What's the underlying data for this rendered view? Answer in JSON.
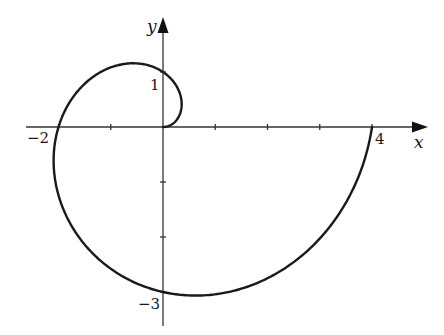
{
  "chart_data": {
    "type": "line",
    "title": "",
    "subtitle": "",
    "xlabel": "x",
    "ylabel": "y",
    "curve": "Archimedean spiral r = 2θ/π, θ from 0 to 2π",
    "xlim": [
      -2.2,
      5.0
    ],
    "ylim": [
      -3.5,
      2.0
    ],
    "grid": false,
    "legend": null,
    "x_ticks": [
      -2,
      -1,
      1,
      2,
      3,
      4
    ],
    "y_ticks": [
      1,
      -1,
      -2,
      -3
    ],
    "labeled_ticks": {
      "x": [
        {
          "value": -2,
          "label": "−2"
        },
        {
          "value": 4,
          "label": "4"
        }
      ],
      "y": [
        {
          "value": 1,
          "label": "1"
        },
        {
          "value": -3,
          "label": "−3"
        }
      ]
    },
    "series": [
      {
        "name": "spiral",
        "points": [
          {
            "x": 0,
            "y": 0
          },
          {
            "x": 0.35,
            "y": 0.35
          },
          {
            "x": 0,
            "y": 1
          },
          {
            "x": -1.06,
            "y": 1.06
          },
          {
            "x": -2,
            "y": 0
          },
          {
            "x": -1.77,
            "y": -1.77
          },
          {
            "x": 0,
            "y": -3
          },
          {
            "x": 2.47,
            "y": -2.47
          },
          {
            "x": 4,
            "y": 0
          }
        ]
      }
    ],
    "axis_labels_text": {
      "x_axis": "x",
      "y_axis": "y",
      "tick_neg2": "−2",
      "tick_4": "4",
      "tick_1": "1",
      "tick_neg3": "−3"
    }
  },
  "render": {
    "origin_px": [
      163,
      127
    ],
    "scale_x": 52.25,
    "scale_y": 55,
    "line_color": "#1a1a1a",
    "axis_color": "#333333"
  }
}
